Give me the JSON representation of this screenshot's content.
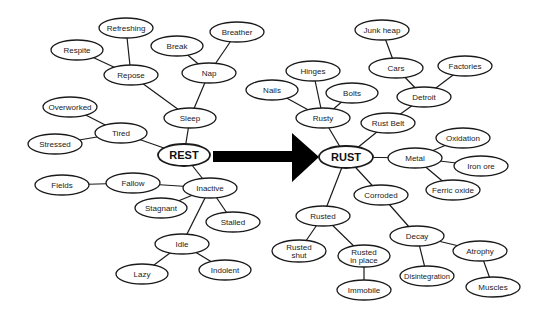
{
  "diagram": {
    "type": "mind-map",
    "transition_arrow": {
      "from": "REST",
      "to": "RUST",
      "color": "#000000"
    },
    "colors": {
      "stroke": "#1a1a1a",
      "fill": "#ffffff",
      "text": "#222222"
    },
    "nodes": [
      {
        "id": "rest",
        "label": "REST",
        "x": 184,
        "y": 155,
        "rx": 26,
        "ry": 11,
        "hub": true
      },
      {
        "id": "sleep",
        "label": "Sleep",
        "x": 190,
        "y": 118,
        "rx": 26,
        "ry": 10
      },
      {
        "id": "repose",
        "label": "Repose",
        "x": 131,
        "y": 75,
        "rx": 27,
        "ry": 10
      },
      {
        "id": "refreshing",
        "label": "Refreshing",
        "x": 126,
        "y": 28,
        "rx": 27,
        "ry": 10
      },
      {
        "id": "respite",
        "label": "Respite",
        "x": 77,
        "y": 50,
        "rx": 26,
        "ry": 10
      },
      {
        "id": "nap",
        "label": "Nap",
        "x": 209,
        "y": 73,
        "rx": 27,
        "ry": 10
      },
      {
        "id": "break",
        "label": "Break",
        "x": 177,
        "y": 46,
        "rx": 26,
        "ry": 10
      },
      {
        "id": "breather",
        "label": "Breather",
        "x": 237,
        "y": 32,
        "rx": 27,
        "ry": 10
      },
      {
        "id": "tired",
        "label": "Tired",
        "x": 121,
        "y": 133,
        "rx": 26,
        "ry": 10
      },
      {
        "id": "overworked",
        "label": "Overworked",
        "x": 70,
        "y": 107,
        "rx": 27,
        "ry": 10
      },
      {
        "id": "stressed",
        "label": "Stressed",
        "x": 55,
        "y": 144,
        "rx": 27,
        "ry": 10
      },
      {
        "id": "inactive",
        "label": "Inactive",
        "x": 210,
        "y": 188,
        "rx": 27,
        "ry": 10
      },
      {
        "id": "fallow",
        "label": "Fallow",
        "x": 133,
        "y": 183,
        "rx": 27,
        "ry": 10
      },
      {
        "id": "fields",
        "label": "Fields",
        "x": 62,
        "y": 185,
        "rx": 27,
        "ry": 10
      },
      {
        "id": "stagnant",
        "label": "Stagnant",
        "x": 161,
        "y": 208,
        "rx": 26,
        "ry": 10
      },
      {
        "id": "stalled",
        "label": "Stalled",
        "x": 233,
        "y": 222,
        "rx": 27,
        "ry": 10
      },
      {
        "id": "idle",
        "label": "Idle",
        "x": 182,
        "y": 244,
        "rx": 27,
        "ry": 10
      },
      {
        "id": "lazy",
        "label": "Lazy",
        "x": 142,
        "y": 274,
        "rx": 26,
        "ry": 10
      },
      {
        "id": "indolent",
        "label": "Indolent",
        "x": 225,
        "y": 270,
        "rx": 26,
        "ry": 10
      },
      {
        "id": "rust",
        "label": "RUST",
        "x": 346,
        "y": 157,
        "rx": 27,
        "ry": 11,
        "hub": true
      },
      {
        "id": "rusty",
        "label": "Rusty",
        "x": 323,
        "y": 118,
        "rx": 27,
        "ry": 10
      },
      {
        "id": "hinges",
        "label": "Hinges",
        "x": 313,
        "y": 71,
        "rx": 27,
        "ry": 10
      },
      {
        "id": "nails",
        "label": "Nails",
        "x": 272,
        "y": 90,
        "rx": 26,
        "ry": 10
      },
      {
        "id": "bolts",
        "label": "Bolts",
        "x": 352,
        "y": 93,
        "rx": 26,
        "ry": 10
      },
      {
        "id": "rust-belt",
        "label": "Rust Belt",
        "x": 388,
        "y": 123,
        "rx": 27,
        "ry": 10
      },
      {
        "id": "detroit",
        "label": "Detroit",
        "x": 424,
        "y": 97,
        "rx": 27,
        "ry": 10
      },
      {
        "id": "cars",
        "label": "Cars",
        "x": 396,
        "y": 68,
        "rx": 27,
        "ry": 10
      },
      {
        "id": "junk-heap",
        "label": "Junk heap",
        "x": 382,
        "y": 30,
        "rx": 27,
        "ry": 10
      },
      {
        "id": "factories",
        "label": "Factories",
        "x": 465,
        "y": 66,
        "rx": 27,
        "ry": 10
      },
      {
        "id": "metal",
        "label": "Metal",
        "x": 415,
        "y": 158,
        "rx": 27,
        "ry": 10
      },
      {
        "id": "oxidation",
        "label": "Oxidation",
        "x": 463,
        "y": 138,
        "rx": 27,
        "ry": 10
      },
      {
        "id": "iron-ore",
        "label": "Iron ore",
        "x": 481,
        "y": 166,
        "rx": 27,
        "ry": 10
      },
      {
        "id": "ferric-oxide",
        "label": "Ferric oxide",
        "x": 453,
        "y": 190,
        "rx": 27,
        "ry": 10
      },
      {
        "id": "corroded",
        "label": "Corroded",
        "x": 381,
        "y": 195,
        "rx": 27,
        "ry": 10
      },
      {
        "id": "decay",
        "label": "Decay",
        "x": 417,
        "y": 236,
        "rx": 27,
        "ry": 10
      },
      {
        "id": "atrophy",
        "label": "Atrophy",
        "x": 480,
        "y": 251,
        "rx": 27,
        "ry": 10
      },
      {
        "id": "muscles",
        "label": "Muscles",
        "x": 493,
        "y": 287,
        "rx": 27,
        "ry": 10
      },
      {
        "id": "disintegration",
        "label": "Disintegration",
        "x": 427,
        "y": 276,
        "rx": 27,
        "ry": 10,
        "small": true
      },
      {
        "id": "rusted",
        "label": "Rusted",
        "x": 323,
        "y": 216,
        "rx": 27,
        "ry": 10
      },
      {
        "id": "rusted-shut",
        "label": "Rusted\nshut",
        "x": 299,
        "y": 251,
        "rx": 27,
        "ry": 11
      },
      {
        "id": "rusted-in-place",
        "label": "Rusted\nin place",
        "x": 364,
        "y": 256,
        "rx": 26,
        "ry": 11
      },
      {
        "id": "immobile",
        "label": "Immobile",
        "x": 364,
        "y": 290,
        "rx": 27,
        "ry": 10
      }
    ],
    "edges": [
      [
        "rest",
        "sleep"
      ],
      [
        "sleep",
        "repose"
      ],
      [
        "sleep",
        "nap"
      ],
      [
        "repose",
        "refreshing"
      ],
      [
        "repose",
        "respite"
      ],
      [
        "nap",
        "break"
      ],
      [
        "nap",
        "breather"
      ],
      [
        "rest",
        "tired"
      ],
      [
        "tired",
        "overworked"
      ],
      [
        "tired",
        "stressed"
      ],
      [
        "rest",
        "inactive"
      ],
      [
        "inactive",
        "fallow"
      ],
      [
        "fallow",
        "fields"
      ],
      [
        "inactive",
        "stagnant"
      ],
      [
        "inactive",
        "stalled"
      ],
      [
        "inactive",
        "idle"
      ],
      [
        "idle",
        "lazy"
      ],
      [
        "idle",
        "indolent"
      ],
      [
        "rust",
        "rusty"
      ],
      [
        "rusty",
        "hinges"
      ],
      [
        "rusty",
        "nails"
      ],
      [
        "rusty",
        "bolts"
      ],
      [
        "rust",
        "rust-belt"
      ],
      [
        "rust-belt",
        "detroit"
      ],
      [
        "detroit",
        "cars"
      ],
      [
        "cars",
        "junk-heap"
      ],
      [
        "detroit",
        "factories"
      ],
      [
        "rust",
        "metal"
      ],
      [
        "metal",
        "oxidation"
      ],
      [
        "metal",
        "iron-ore"
      ],
      [
        "metal",
        "ferric-oxide"
      ],
      [
        "rust",
        "corroded"
      ],
      [
        "corroded",
        "decay"
      ],
      [
        "decay",
        "atrophy"
      ],
      [
        "atrophy",
        "muscles"
      ],
      [
        "decay",
        "disintegration"
      ],
      [
        "rust",
        "rusted"
      ],
      [
        "rusted",
        "rusted-shut"
      ],
      [
        "rusted",
        "rusted-in-place"
      ],
      [
        "rusted-in-place",
        "immobile"
      ]
    ]
  }
}
